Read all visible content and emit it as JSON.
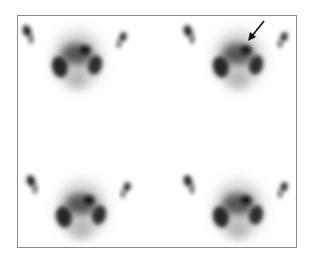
{
  "figure": {
    "type": "scintigraphy",
    "layout": "2x2 grid",
    "background": "#ffffff",
    "border_color": "#8a8a8a",
    "panels": [
      {
        "position": "top-left",
        "label": ""
      },
      {
        "position": "top-right",
        "label": "",
        "annotation": "arrow"
      },
      {
        "position": "bottom-left",
        "label": ""
      },
      {
        "position": "bottom-right",
        "label": ""
      }
    ],
    "annotation": {
      "type": "arrow",
      "direction": "down-left",
      "color": "#111111"
    }
  }
}
